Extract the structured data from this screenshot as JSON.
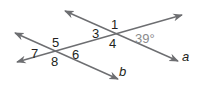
{
  "diagram": {
    "type": "parallel-lines-transversal",
    "colors": {
      "line": "#6d6e71",
      "text": "#231f20",
      "angle_measure": "#8a8a8a"
    },
    "lines": [
      {
        "name": "a",
        "label": "a",
        "from": [
          65,
          11
        ],
        "to": [
          178,
          61
        ]
      },
      {
        "name": "b",
        "label": "b",
        "from": [
          15,
          33
        ],
        "to": [
          118,
          79
        ]
      },
      {
        "name": "transversal",
        "label": "",
        "from": [
          17,
          62
        ],
        "to": [
          182,
          15
        ]
      }
    ],
    "angle_labels": {
      "1": "1",
      "2": "39°",
      "3": "3",
      "4": "4",
      "5": "5",
      "6": "6",
      "7": "7",
      "8": "8"
    },
    "line_labels": {
      "a": "a",
      "b": "b"
    }
  }
}
